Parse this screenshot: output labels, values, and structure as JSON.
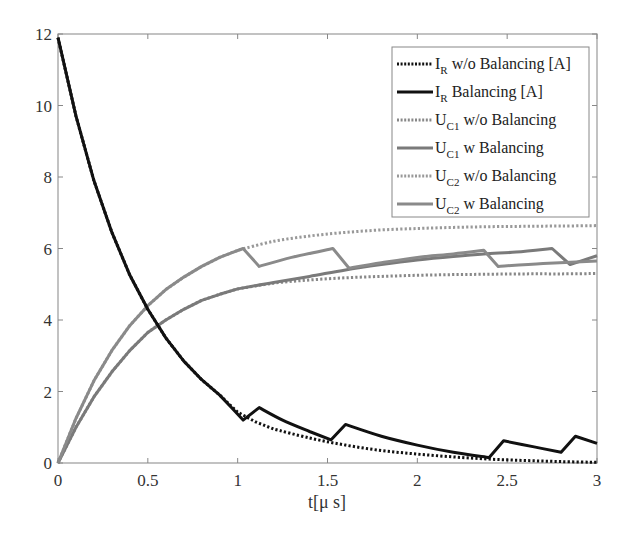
{
  "chart_data": {
    "type": "line",
    "title": "",
    "xlabel": "t[μ s]",
    "ylabel": "",
    "xlim": [
      0,
      3
    ],
    "ylim": [
      0,
      12
    ],
    "xticks": [
      0,
      0.5,
      1,
      1.5,
      2,
      2.5,
      3
    ],
    "xtick_labels": [
      "0",
      "0.5",
      "1",
      "1.5",
      "2",
      "2.5",
      "3"
    ],
    "yticks": [
      0,
      2,
      4,
      6,
      8,
      10,
      12
    ],
    "ytick_labels": [
      "0",
      "2",
      "4",
      "6",
      "8",
      "10",
      "12"
    ],
    "grid": false,
    "legend_position": "upper right",
    "series": [
      {
        "name": "I_R w/o Balancing [A]",
        "label_main": "I",
        "label_sub": "R",
        "label_rest": " w/o Balancing [A]",
        "color": "#111111",
        "style": "dotted",
        "width": 3,
        "x": [
          0,
          0.1,
          0.2,
          0.3,
          0.4,
          0.5,
          0.6,
          0.7,
          0.8,
          0.9,
          1.0,
          1.1,
          1.2,
          1.4,
          1.6,
          1.8,
          2.0,
          2.2,
          2.4,
          2.6,
          2.8,
          3.0
        ],
        "values": [
          11.9,
          9.7,
          7.9,
          6.45,
          5.25,
          4.3,
          3.5,
          2.85,
          2.33,
          1.9,
          1.42,
          1.15,
          0.95,
          0.7,
          0.5,
          0.35,
          0.25,
          0.17,
          0.11,
          0.07,
          0.04,
          0.02
        ]
      },
      {
        "name": "I_R Balancing [A]",
        "label_main": "I",
        "label_sub": "R",
        "label_rest": " Balancing [A]",
        "color": "#111111",
        "style": "solid",
        "width": 3,
        "x": [
          0,
          0.1,
          0.2,
          0.3,
          0.4,
          0.5,
          0.6,
          0.7,
          0.8,
          0.9,
          1.03,
          1.12,
          1.25,
          1.4,
          1.52,
          1.6,
          1.8,
          2.0,
          2.2,
          2.4,
          2.48,
          2.65,
          2.8,
          2.88,
          3.0
        ],
        "values": [
          11.9,
          9.7,
          7.9,
          6.45,
          5.25,
          4.3,
          3.5,
          2.85,
          2.33,
          1.9,
          1.2,
          1.55,
          1.2,
          0.88,
          0.65,
          1.08,
          0.75,
          0.5,
          0.3,
          0.15,
          0.62,
          0.45,
          0.3,
          0.75,
          0.55
        ]
      },
      {
        "name": "U_C1 w/o Balancing",
        "label_main": "U",
        "label_sub": "C1",
        "label_rest": " w/o Balancing",
        "color": "#888888",
        "style": "dotted",
        "width": 3,
        "x": [
          0,
          0.1,
          0.2,
          0.3,
          0.4,
          0.5,
          0.6,
          0.7,
          0.8,
          0.9,
          1.0,
          1.2,
          1.4,
          1.6,
          1.8,
          2.0,
          2.2,
          2.4,
          2.6,
          2.8,
          3.0
        ],
        "values": [
          0,
          1.0,
          1.85,
          2.55,
          3.15,
          3.65,
          4.0,
          4.3,
          4.55,
          4.72,
          4.87,
          5.03,
          5.12,
          5.18,
          5.22,
          5.25,
          5.27,
          5.28,
          5.29,
          5.29,
          5.3
        ]
      },
      {
        "name": "U_C1 w Balancing",
        "label_main": "U",
        "label_sub": "C1",
        "label_rest": " w Balancing",
        "color": "#7a7a7a",
        "style": "solid",
        "width": 3,
        "x": [
          0,
          0.1,
          0.2,
          0.3,
          0.4,
          0.5,
          0.6,
          0.7,
          0.8,
          0.9,
          1.0,
          1.2,
          1.4,
          1.6,
          1.8,
          2.0,
          2.2,
          2.37,
          2.55,
          2.75,
          2.85,
          3.0
        ],
        "values": [
          0,
          1.0,
          1.85,
          2.55,
          3.15,
          3.65,
          4.0,
          4.3,
          4.55,
          4.72,
          4.87,
          5.05,
          5.22,
          5.4,
          5.55,
          5.68,
          5.78,
          5.85,
          5.9,
          6.0,
          5.55,
          5.8
        ]
      },
      {
        "name": "U_C2 w/o Balancing",
        "label_main": "U",
        "label_sub": "C2",
        "label_rest": " w/o Balancing",
        "color": "#999999",
        "style": "dotted",
        "width": 3,
        "x": [
          0,
          0.1,
          0.2,
          0.3,
          0.4,
          0.5,
          0.6,
          0.7,
          0.8,
          0.9,
          1.0,
          1.2,
          1.4,
          1.6,
          1.8,
          2.0,
          2.2,
          2.4,
          2.6,
          2.8,
          3.0
        ],
        "values": [
          0,
          1.25,
          2.3,
          3.15,
          3.85,
          4.4,
          4.85,
          5.2,
          5.5,
          5.75,
          5.95,
          6.2,
          6.35,
          6.45,
          6.52,
          6.56,
          6.59,
          6.61,
          6.62,
          6.63,
          6.64
        ]
      },
      {
        "name": "U_C2 w Balancing",
        "label_main": "U",
        "label_sub": "C2",
        "label_rest": " w Balancing",
        "color": "#8a8a8a",
        "style": "solid",
        "width": 3,
        "x": [
          0,
          0.1,
          0.2,
          0.3,
          0.4,
          0.5,
          0.6,
          0.7,
          0.8,
          0.9,
          1.03,
          1.12,
          1.3,
          1.53,
          1.62,
          1.8,
          2.0,
          2.2,
          2.37,
          2.45,
          2.7,
          3.0
        ],
        "values": [
          0,
          1.25,
          2.3,
          3.15,
          3.85,
          4.4,
          4.85,
          5.2,
          5.5,
          5.75,
          6.0,
          5.5,
          5.75,
          6.0,
          5.45,
          5.6,
          5.75,
          5.85,
          5.95,
          5.5,
          5.58,
          5.65
        ]
      }
    ]
  }
}
